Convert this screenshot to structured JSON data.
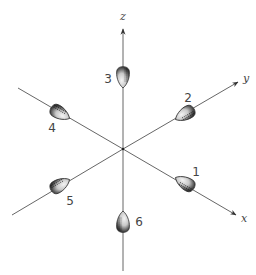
{
  "diagram": {
    "colors": {
      "axis": "#555555",
      "lobe_fill_light": "#f2f2f2",
      "lobe_fill_dark": "#2a2a2a",
      "text": "#444444"
    },
    "origin": {
      "x": 123,
      "y": 149
    },
    "axes": [
      {
        "name": "z",
        "label": "z",
        "direction": "up",
        "arrow": true,
        "end": {
          "x": 123,
          "y": 29
        },
        "label_pos": {
          "x": 123,
          "y": 20
        }
      },
      {
        "name": "y",
        "label": "y",
        "direction": "upper-right",
        "arrow": true,
        "end": {
          "x": 238,
          "y": 82
        },
        "label_pos": {
          "x": 246,
          "y": 82
        }
      },
      {
        "name": "x",
        "label": "x",
        "direction": "lower-right",
        "arrow": true,
        "end": {
          "x": 236,
          "y": 215
        },
        "label_pos": {
          "x": 244,
          "y": 222
        }
      },
      {
        "name": "-y",
        "label": "",
        "direction": "upper-left",
        "arrow": false,
        "end": {
          "x": 18,
          "y": 88
        }
      },
      {
        "name": "-x",
        "label": "",
        "direction": "lower-left",
        "arrow": false,
        "end": {
          "x": 12,
          "y": 215
        }
      },
      {
        "name": "-z",
        "label": "",
        "direction": "down",
        "arrow": false,
        "end": {
          "x": 123,
          "y": 271
        }
      }
    ],
    "lobes": [
      {
        "id": 1,
        "label": "1",
        "axis": "+x",
        "center": {
          "x": 185,
          "y": 183
        },
        "angle": 30,
        "label_pos": {
          "x": 196,
          "y": 176
        }
      },
      {
        "id": 2,
        "label": "2",
        "axis": "+y",
        "center": {
          "x": 185,
          "y": 114
        },
        "angle": -30,
        "label_pos": {
          "x": 188,
          "y": 102
        }
      },
      {
        "id": 3,
        "label": "3",
        "axis": "+z",
        "center": {
          "x": 123,
          "y": 77
        },
        "angle": -90,
        "label_pos": {
          "x": 108,
          "y": 83
        }
      },
      {
        "id": 4,
        "label": "4",
        "axis": "-y",
        "center": {
          "x": 60,
          "y": 113
        },
        "angle": 210,
        "label_pos": {
          "x": 52,
          "y": 132
        }
      },
      {
        "id": 5,
        "label": "5",
        "axis": "-x",
        "center": {
          "x": 60,
          "y": 185
        },
        "angle": 150,
        "label_pos": {
          "x": 70,
          "y": 205
        }
      },
      {
        "id": 6,
        "label": "6",
        "axis": "-z",
        "center": {
          "x": 123,
          "y": 222
        },
        "angle": 90,
        "label_pos": {
          "x": 139,
          "y": 226
        }
      }
    ]
  }
}
